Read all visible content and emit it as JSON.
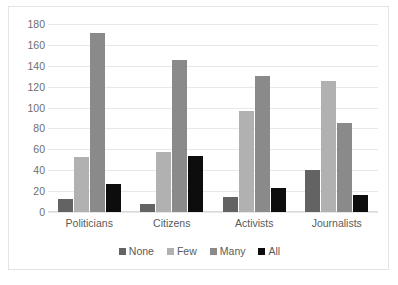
{
  "chart_data": {
    "type": "bar",
    "title": "",
    "subtitle": "",
    "xlabel": "",
    "ylabel": "",
    "categories": [
      "Politicians",
      "Citizens",
      "Activists",
      "Journalists"
    ],
    "series": [
      {
        "name": "None",
        "color": "#636363",
        "values": [
          12,
          8,
          14,
          40
        ]
      },
      {
        "name": "Few",
        "color": "#b1b1b1",
        "values": [
          53,
          57,
          97,
          125
        ]
      },
      {
        "name": "Many",
        "color": "#8a8a8a",
        "values": [
          171,
          146,
          130,
          85
        ]
      },
      {
        "name": "All",
        "color": "#0d0d0d",
        "values": [
          27,
          54,
          23,
          16
        ]
      }
    ],
    "ylim": [
      0,
      180
    ],
    "ytick_values": [
      180,
      160,
      140,
      120,
      100,
      80,
      60,
      40,
      20,
      0
    ],
    "yticks": [
      "180",
      "160",
      "140",
      "120",
      "100",
      "80",
      "60",
      "40",
      "20",
      "0"
    ],
    "grid": true,
    "legend_position": "bottom",
    "annotations": []
  },
  "legend": {
    "items": [
      {
        "label": "None",
        "color": "#636363"
      },
      {
        "label": "Few",
        "color": "#b1b1b1"
      },
      {
        "label": "Many",
        "color": "#8a8a8a"
      },
      {
        "label": "All",
        "color": "#0d0d0d"
      }
    ]
  },
  "colors": {
    "plot_background": "#ffffff",
    "frame_border": "#e3e3e3",
    "gridline": "#e8e8e8",
    "tick_text": "#6e6e6e",
    "label_text": "#5a5a5a"
  }
}
